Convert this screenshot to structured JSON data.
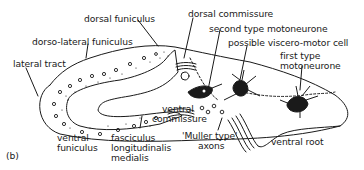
{
  "figure": {
    "panel_label": "(b)",
    "line_color": "#1a1a1a",
    "background": "#ffffff"
  },
  "labels": {
    "dorsal_funiculus": "dorsal funiculus",
    "dorso_lateral_funiculus": "dorso-lateral funiculus",
    "lateral_tract": "lateral tract",
    "ventral_funiculus_1": "ventral",
    "ventral_funiculus_2": "funiculus",
    "flm_1": "fasciculus",
    "flm_2": "longitudinalis",
    "flm_3": "medialis",
    "ventral_commissure_1": "ventral",
    "ventral_commissure_2": "commissure",
    "muller_axons_1": "'Muller type'",
    "muller_axons_2": "axons",
    "ventral_root": "ventral root",
    "dorsal_commissure": "dorsal commissure",
    "second_type_motoneurone": "second type motoneurone",
    "viscero_motor_cell": "possible viscero-motor cell",
    "first_type_motoneurone_1": "first type",
    "first_type_motoneurone_2": "motoneurone"
  }
}
